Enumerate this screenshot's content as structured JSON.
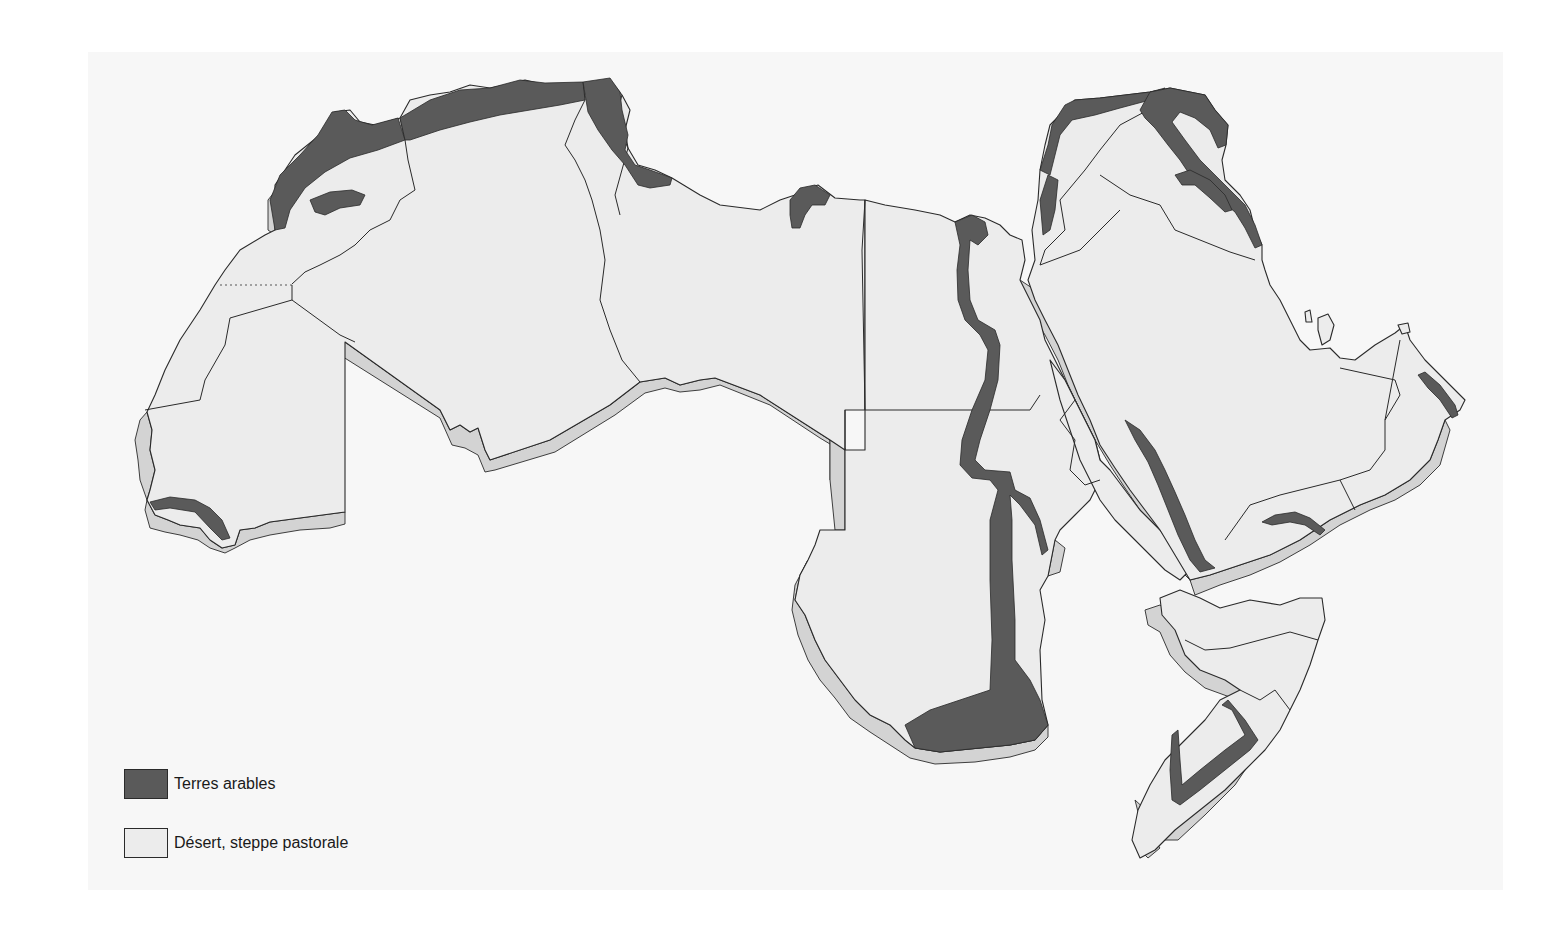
{
  "map": {
    "subject": "Arab world land use map",
    "colors": {
      "background": "#ffffff",
      "panel": "#f7f7f7",
      "arable": "#5a5a5a",
      "desert": "#ececec",
      "relief_edge": "#d3d3d3",
      "outline": "#2a2a2a"
    }
  },
  "legend": {
    "items": [
      {
        "label": "Terres arables",
        "color": "#5a5a5a"
      },
      {
        "label": "Désert, steppe pastorale",
        "color": "#ececec"
      }
    ]
  }
}
